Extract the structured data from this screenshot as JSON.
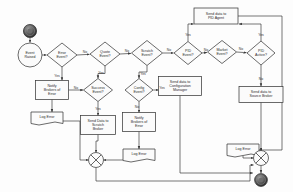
{
  "diagram": {
    "type": "flowchart",
    "colors": {
      "stroke": "#3a3a3a",
      "fill": "#fbfbfb",
      "text": "#2b2b2b",
      "background": "#fdfdfd"
    },
    "nodes": [
      {
        "id": "start",
        "shape": "start-terminator",
        "label": "",
        "x": 30,
        "y": 30,
        "w": 14,
        "h": 14
      },
      {
        "id": "event-raised",
        "shape": "circle",
        "label": "Event\nRaised",
        "x": 30,
        "y": 55,
        "w": 24,
        "h": 24
      },
      {
        "id": "error-event",
        "shape": "diamond",
        "label": "Error\nEvent?",
        "x": 62,
        "y": 55,
        "w": 30,
        "h": 24
      },
      {
        "id": "quote-event",
        "shape": "diamond",
        "label": "Quote\nEvent?",
        "x": 105,
        "y": 54,
        "w": 30,
        "h": 24
      },
      {
        "id": "scratch-event",
        "shape": "diamond",
        "label": "Scratch\nEvent?",
        "x": 147,
        "y": 53,
        "w": 31,
        "h": 25
      },
      {
        "id": "pid-event",
        "shape": "diamond",
        "label": "PID\nEvent?",
        "x": 188,
        "y": 53,
        "w": 28,
        "h": 23
      },
      {
        "id": "market-event",
        "shape": "diamond",
        "label": "Market\nEvent?",
        "x": 222,
        "y": 52,
        "w": 29,
        "h": 23
      },
      {
        "id": "pid-active",
        "shape": "diamond",
        "label": "PID\nActive?",
        "x": 261,
        "y": 53,
        "w": 28,
        "h": 24
      },
      {
        "id": "send-pid",
        "shape": "process",
        "label": "Send data to\nPID Agent",
        "x": 216,
        "y": 16,
        "w": 44,
        "h": 16
      },
      {
        "id": "notify-err-1",
        "shape": "process",
        "label": "Notify\nBrokers of\nError",
        "x": 52,
        "y": 90,
        "w": 33,
        "h": 19
      },
      {
        "id": "success-evt",
        "shape": "diamond",
        "label": "Success\nEvent?",
        "x": 98,
        "y": 90,
        "w": 29,
        "h": 23
      },
      {
        "id": "config-evt",
        "shape": "diamond",
        "label": "Config\nEvent?",
        "x": 139,
        "y": 90,
        "w": 28,
        "h": 23
      },
      {
        "id": "send-config",
        "shape": "process",
        "label": "Send data to\nConfiguration\nManager",
        "x": 180,
        "y": 86,
        "w": 43,
        "h": 19
      },
      {
        "id": "send-scratch",
        "shape": "process",
        "label": "Send Data to\nScratch\nBroker",
        "x": 98,
        "y": 125,
        "w": 35,
        "h": 19
      },
      {
        "id": "notify-err-2",
        "shape": "process",
        "label": "Notify\nBrokers of\nError",
        "x": 139,
        "y": 122,
        "w": 33,
        "h": 19
      },
      {
        "id": "send-source",
        "shape": "process",
        "label": "Send data to\nSource Broker",
        "x": 261,
        "y": 94,
        "w": 44,
        "h": 16
      },
      {
        "id": "log-error-1",
        "shape": "document",
        "label": "Log Error",
        "x": 47,
        "y": 118,
        "w": 32,
        "h": 12
      },
      {
        "id": "log-error-2",
        "shape": "document",
        "label": "Log Error",
        "x": 139,
        "y": 155,
        "w": 32,
        "h": 12
      },
      {
        "id": "log-error-3",
        "shape": "document",
        "label": "Log Error",
        "x": 243,
        "y": 150,
        "w": 32,
        "h": 12
      },
      {
        "id": "merge-left",
        "shape": "merge-circle",
        "label": "",
        "x": 96,
        "y": 160,
        "w": 15,
        "h": 15
      },
      {
        "id": "merge-right",
        "shape": "merge-circle",
        "label": "",
        "x": 261,
        "y": 158,
        "w": 15,
        "h": 15
      },
      {
        "id": "end",
        "shape": "end-terminator",
        "label": "",
        "x": 261,
        "y": 180,
        "w": 13,
        "h": 13
      }
    ],
    "edge_labels": [
      {
        "id": "error-no",
        "text": "No",
        "x": 85,
        "y": 52
      },
      {
        "id": "quote-no",
        "text": "No",
        "x": 127,
        "y": 51
      },
      {
        "id": "scratch-no",
        "text": "No",
        "x": 169,
        "y": 50
      },
      {
        "id": "pid-no",
        "text": "No",
        "x": 206,
        "y": 50
      },
      {
        "id": "market-no",
        "text": "No",
        "x": 241,
        "y": 49
      },
      {
        "id": "pid-evt-yes",
        "text": "Yes",
        "x": 188,
        "y": 35
      },
      {
        "id": "pid-act-yes",
        "text": "Yes",
        "x": 261,
        "y": 35
      },
      {
        "id": "error-yes",
        "text": "Yes",
        "x": 57,
        "y": 76
      },
      {
        "id": "notify-no",
        "text": "No",
        "x": 76,
        "y": 90
      },
      {
        "id": "quote-yes",
        "text": "Yes",
        "x": 101,
        "y": 74
      },
      {
        "id": "scratch-yes",
        "text": "Yes",
        "x": 143,
        "y": 75
      },
      {
        "id": "config-yes",
        "text": "Yes",
        "x": 161,
        "y": 89
      },
      {
        "id": "config-no",
        "text": "No",
        "x": 137,
        "y": 107
      },
      {
        "id": "success-yes",
        "text": "Yes",
        "x": 98,
        "y": 110
      },
      {
        "id": "pid-act-no",
        "text": "No",
        "x": 261,
        "y": 80
      }
    ]
  }
}
